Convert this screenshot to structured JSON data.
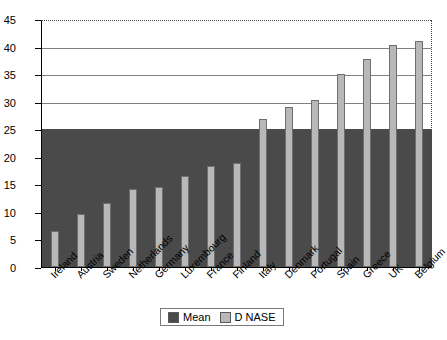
{
  "chart_data": {
    "type": "bar",
    "title": "",
    "xlabel": "",
    "ylabel": "",
    "ylim": [
      0,
      45
    ],
    "ytick_step": 5,
    "yticks": [
      0,
      5,
      10,
      15,
      20,
      25,
      30,
      35,
      40,
      45
    ],
    "grid": true,
    "legend_position": "bottom",
    "categories": [
      "Ireland",
      "Austria",
      "Sweden",
      "Netherlands",
      "Germany",
      "Luxembourg",
      "France",
      "Finland",
      "Italy",
      "Denmark",
      "Portugal",
      "Spain",
      "Greece",
      "UK",
      "Belgium"
    ],
    "series": [
      {
        "name": "Mean",
        "color": "#4a4a4a",
        "values": [
          25,
          25,
          25,
          25,
          25,
          25,
          25,
          25,
          25,
          25,
          25,
          25,
          25,
          25,
          25
        ]
      },
      {
        "name": "D NASE",
        "color": "#b8b8b8",
        "values": [
          6.5,
          9.6,
          11.7,
          14.2,
          14.5,
          16.5,
          18.3,
          18.8,
          26.8,
          29.0,
          30.3,
          35.0,
          37.7,
          40.2,
          41.1
        ]
      }
    ]
  },
  "legend": {
    "items": [
      {
        "label": "Mean",
        "swatch": "mean-swatch"
      },
      {
        "label": "D NASE",
        "swatch": "nase-swatch"
      }
    ]
  },
  "axis": {
    "y_labels": [
      "0",
      "5",
      "10",
      "15",
      "20",
      "25",
      "30",
      "35",
      "40",
      "45"
    ]
  }
}
